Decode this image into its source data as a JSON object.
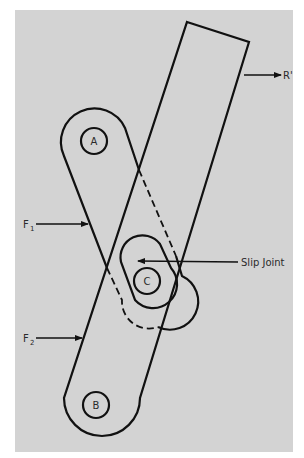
{
  "figure": {
    "background": "#d3d3d3",
    "line_color": "#111111",
    "labels": {
      "pivot_a": "A",
      "pivot_b": "B",
      "pivot_c": "C",
      "force_1": "F",
      "force_1_sub": "1",
      "force_2": "F",
      "force_2_sub": "2",
      "reaction": "R'",
      "slip_joint": "Slip Joint"
    }
  }
}
